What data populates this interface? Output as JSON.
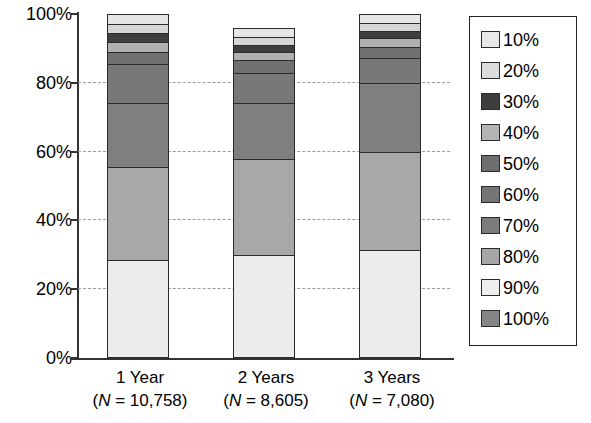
{
  "chart_data": {
    "type": "bar",
    "stacked": true,
    "title": "",
    "xlabel": "",
    "ylabel": "",
    "ylim": [
      0,
      100
    ],
    "y_tick_labels": [
      "0%",
      "20%",
      "40%",
      "60%",
      "80%",
      "100%"
    ],
    "y_ticks": [
      0,
      20,
      40,
      60,
      80,
      100
    ],
    "grid": "horizontal-dashed",
    "legend_position": "right",
    "categories": [
      "1 Year",
      "2 Years",
      "3 Years"
    ],
    "category_sublabels": [
      "(N = 10,758)",
      "(N = 8,605)",
      "(N = 7,080)"
    ],
    "category_n_values": [
      "10,758",
      "8,605",
      "7,080"
    ],
    "series": [
      {
        "name": "10%",
        "color": "#e6e6e6",
        "values": [
          3.0,
          2.6,
          2.6
        ]
      },
      {
        "name": "20%",
        "color": "#d6d6d6",
        "values": [
          2.5,
          2.3,
          2.3
        ]
      },
      {
        "name": "30%",
        "color": "#3f3f3f",
        "values": [
          2.5,
          2.0,
          2.0
        ]
      },
      {
        "name": "40%",
        "color": "#b0b0b0",
        "values": [
          3.0,
          2.6,
          2.6
        ]
      },
      {
        "name": "50%",
        "color": "#707070",
        "values": [
          3.5,
          3.5,
          3.2
        ]
      },
      {
        "name": "60%",
        "color": "#787878",
        "values": [
          11.5,
          9.0,
          7.3
        ]
      },
      {
        "name": "70%",
        "color": "#7f7f7f",
        "values": [
          18.5,
          16.0,
          20.0
        ]
      },
      {
        "name": "80%",
        "color": "#a8a8a8",
        "values": [
          27.0,
          28.0,
          28.5
        ]
      },
      {
        "name": "90%",
        "color": "#ececec",
        "values": [
          28.5,
          30.0,
          31.5
        ]
      },
      {
        "name": "100%",
        "color": "#878787",
        "values": [
          0,
          0,
          0
        ]
      }
    ],
    "series_order_bottom_to_top": [
      "90%",
      "80%",
      "70%",
      "60%",
      "50%",
      "40%",
      "30%",
      "20%",
      "10%"
    ]
  },
  "legend": {
    "items": [
      {
        "label": "10%",
        "color": "#e9e9e9"
      },
      {
        "label": "20%",
        "color": "#dcdcdc"
      },
      {
        "label": "30%",
        "color": "#3d3d3d"
      },
      {
        "label": "40%",
        "color": "#b4b4b4"
      },
      {
        "label": "50%",
        "color": "#6e6e6e"
      },
      {
        "label": "60%",
        "color": "#757575"
      },
      {
        "label": "70%",
        "color": "#7c7c7c"
      },
      {
        "label": "80%",
        "color": "#a6a6a6"
      },
      {
        "label": "90%",
        "color": "#ededed"
      },
      {
        "label": "100%",
        "color": "#858585"
      }
    ]
  },
  "axis": {
    "y_labels": [
      "100%",
      "80%",
      "60%",
      "40%",
      "20%",
      "0%"
    ]
  }
}
